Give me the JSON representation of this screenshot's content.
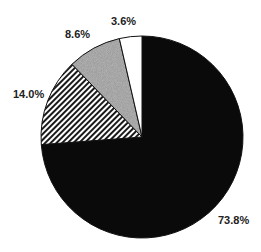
{
  "chart_data": {
    "type": "pie",
    "title": "",
    "start_angle_deg": 0,
    "direction": "clockwise",
    "slices": [
      {
        "label": "73.8%",
        "value": 73.8,
        "fill": "solid-black",
        "color": "#0a0a0a"
      },
      {
        "label": "14.0%",
        "value": 14.0,
        "fill": "diagonal-hatch",
        "color": "#1a1a1a"
      },
      {
        "label": "8.6%",
        "value": 8.6,
        "fill": "gray-speckle",
        "color": "#8a8a8a"
      },
      {
        "label": "3.6%",
        "value": 3.6,
        "fill": "white",
        "color": "#ffffff"
      }
    ],
    "legend": "none"
  },
  "labels": {
    "black": "73.8%",
    "hatched": "14.0%",
    "gray": "8.6%",
    "white": "3.6%"
  }
}
